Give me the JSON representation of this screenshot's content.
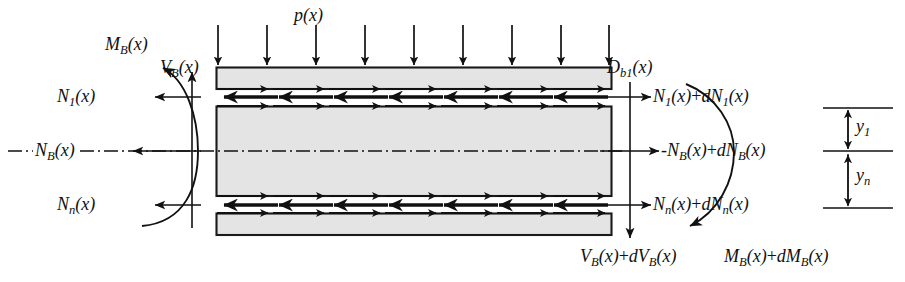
{
  "figure": {
    "type": "free-body-diagram",
    "background_color": "#ffffff",
    "line_color": "#111111",
    "beam_fill_color": "#e3e3e3",
    "beam_edge_color": "#1a1a1a"
  },
  "load": {
    "label_main": "p",
    "label_arg": "(x)",
    "arrow_count": 9,
    "direction": "down"
  },
  "beam": {
    "left_x": 216,
    "right_x": 612,
    "layers": [
      {
        "name": "top-flange",
        "y_top": 67,
        "y_bottom": 89
      },
      {
        "name": "web-core",
        "y_top": 106,
        "y_bottom": 196
      },
      {
        "name": "bottom-flange",
        "y_top": 213,
        "y_bottom": 235
      }
    ],
    "interface_arrow_rows": [
      {
        "name": "row-1-top-interface",
        "y": 89,
        "dir": "right",
        "weight": "thin",
        "count": 7
      },
      {
        "name": "row-2-top-gap",
        "y": 97,
        "dir": "left",
        "weight": "thick",
        "count": 7
      },
      {
        "name": "row-3-core-top",
        "y": 106,
        "dir": "right",
        "weight": "thin",
        "count": 7
      },
      {
        "name": "row-4-core-bottom",
        "y": 196,
        "dir": "right",
        "weight": "thin",
        "count": 7
      },
      {
        "name": "row-5-bottom-gap",
        "y": 205,
        "dir": "left",
        "weight": "thick",
        "count": 7
      },
      {
        "name": "row-6-bottom-interface",
        "y": 213,
        "dir": "right",
        "weight": "thin",
        "count": 7
      }
    ],
    "centroid_axis_y": 151,
    "centroid_axis_style": "dash-dot"
  },
  "left_labels": {
    "moment": {
      "base": "M",
      "sub": "B",
      "arg": "(x)"
    },
    "shear": {
      "base": "V",
      "sub": "B",
      "arg": "(x)"
    },
    "n1": {
      "base": "N",
      "sub": "1",
      "arg": "(x)"
    },
    "nb": {
      "base": "N",
      "sub": "B",
      "arg": "(x)"
    },
    "nn": {
      "base": "N",
      "sub": "n",
      "arg": "(x)"
    }
  },
  "right_labels": {
    "dbond": {
      "base": "D",
      "sub": "b1",
      "arg": "(x)"
    },
    "n1": {
      "text_parts": [
        {
          "base": "N",
          "sub": "1",
          "arg": "(x)"
        },
        {
          "plain": "+"
        },
        {
          "base": "dN",
          "sub": "1",
          "arg": "(x)"
        }
      ]
    },
    "nb": {
      "text_parts": [
        {
          "plain": "-"
        },
        {
          "base": "N",
          "sub": "B",
          "arg": "(x)"
        },
        {
          "plain": "+"
        },
        {
          "base": "dN",
          "sub": "B",
          "arg": "(x)"
        }
      ]
    },
    "nn": {
      "text_parts": [
        {
          "base": "N",
          "sub": "n",
          "arg": "(x)"
        },
        {
          "plain": "+"
        },
        {
          "base": "dN",
          "sub": "n",
          "arg": "(x)"
        }
      ]
    },
    "shear": {
      "text_parts": [
        {
          "base": "V",
          "sub": "B",
          "arg": "(x)"
        },
        {
          "plain": "+"
        },
        {
          "base": "dV",
          "sub": "B",
          "arg": "(x)"
        }
      ]
    },
    "moment": {
      "text_parts": [
        {
          "base": "M",
          "sub": "B",
          "arg": "(x)"
        },
        {
          "plain": "+"
        },
        {
          "base": "dM",
          "sub": "B",
          "arg": "(x)"
        }
      ]
    }
  },
  "dimensions": {
    "y1": {
      "base": "y",
      "sub": "1",
      "from_y": 108,
      "to_y": 151
    },
    "yn": {
      "base": "y",
      "sub": "n",
      "from_y": 151,
      "to_y": 208
    },
    "rule_x_left": 823,
    "rule_x_right": 893
  },
  "force_arrows": {
    "left_side": [
      {
        "name": "shear-up",
        "dir": "up",
        "x": 192,
        "y_from": 150,
        "y_to": 72
      },
      {
        "name": "n1-left",
        "dir": "left",
        "y": 97,
        "x_from": 200,
        "x_to": 156
      },
      {
        "name": "nb-left",
        "dir": "left",
        "y": 151,
        "x_from": 200,
        "x_to": 134
      },
      {
        "name": "nn-left",
        "dir": "left",
        "y": 205,
        "x_from": 200,
        "x_to": 156
      }
    ],
    "right_side": [
      {
        "name": "shear-down",
        "dir": "down",
        "x": 630,
        "y_from": 84,
        "y_to": 236
      },
      {
        "name": "n1-right",
        "dir": "right",
        "y": 97,
        "x_from": 601,
        "x_to": 652
      },
      {
        "name": "nb-right",
        "dir": "right",
        "y": 151,
        "x_from": 601,
        "x_to": 660
      },
      {
        "name": "nn-right",
        "dir": "right",
        "y": 205,
        "x_from": 601,
        "x_to": 652
      }
    ]
  }
}
